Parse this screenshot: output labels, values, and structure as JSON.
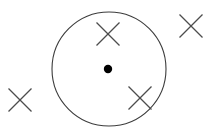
{
  "figure": {
    "title": "Magnetic field into page with circular region and central charge",
    "type": "physics-field-diagram",
    "canvas": {
      "width": 213,
      "height": 137,
      "background_color": "#ffffff"
    },
    "stroke_color": "#4d4d4d",
    "circle_stroke_color": "#3c3c3c",
    "dot_fill_color": "#000000",
    "circle": {
      "label": "field-region-circle",
      "center_x": 109,
      "center_y": 69,
      "radius": 57,
      "stroke_width": 1.1,
      "fill": "none"
    },
    "center_dot": {
      "label": "center-point-charge",
      "center_x": 108,
      "center_y": 69,
      "radius": 4.2
    },
    "x_marks": [
      {
        "label": "x-mark-inside-top",
        "center_x": 108,
        "center_y": 34,
        "size": 23,
        "stroke_width": 1.2,
        "inside_circle": true
      },
      {
        "label": "x-mark-inside-lower-right",
        "center_x": 140,
        "center_y": 98,
        "size": 23,
        "stroke_width": 1.2,
        "inside_circle": true
      },
      {
        "label": "x-mark-outside-top-right",
        "center_x": 191,
        "center_y": 26,
        "size": 23,
        "stroke_width": 1.2,
        "inside_circle": false
      },
      {
        "label": "x-mark-outside-left",
        "center_x": 20,
        "center_y": 100,
        "size": 23,
        "stroke_width": 1.2,
        "inside_circle": false
      }
    ],
    "caption": ""
  }
}
